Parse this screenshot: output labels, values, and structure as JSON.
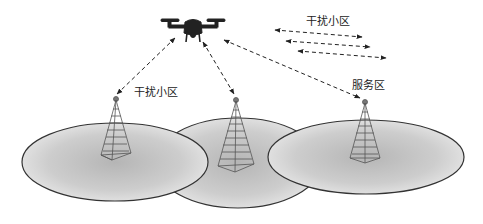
{
  "diagram": {
    "type": "UAV cellular interference scenario",
    "labels": {
      "interference_cell_left": "干扰小区",
      "interference_cell_top": "干扰小区",
      "serving_cell": "服务区"
    },
    "nodes": [
      {
        "id": "uav",
        "kind": "drone",
        "icon": "drone-icon"
      },
      {
        "id": "bs_left",
        "kind": "base-station",
        "icon": "cell-tower-icon",
        "role": "interference"
      },
      {
        "id": "bs_middle",
        "kind": "base-station",
        "icon": "cell-tower-icon",
        "role": "interference"
      },
      {
        "id": "bs_right",
        "kind": "base-station",
        "icon": "cell-tower-icon",
        "role": "serving"
      }
    ],
    "cells": [
      {
        "id": "cell_left",
        "shape": "ellipse"
      },
      {
        "id": "cell_middle",
        "shape": "ellipse"
      },
      {
        "id": "cell_right",
        "shape": "ellipse"
      }
    ],
    "links": [
      {
        "from": "uav",
        "to": "bs_left",
        "style": "dashed-bidirectional"
      },
      {
        "from": "uav",
        "to": "bs_middle",
        "style": "dashed-bidirectional"
      },
      {
        "from": "uav",
        "to": "bs_right",
        "style": "dashed-bidirectional"
      }
    ],
    "legend_arrows": {
      "count": 3,
      "style": "dashed-bidirectional"
    },
    "colors": {
      "stroke": "#222222",
      "cell_fill_center": "#b8b8b8",
      "cell_fill_edge": "#ececec",
      "tower": "#555555"
    }
  }
}
